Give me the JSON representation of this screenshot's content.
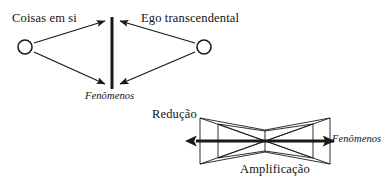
{
  "figure": {
    "stroke_color": "#1a1a1a",
    "background_color": "#ffffff",
    "diagram_left": {
      "name": "esquema-kantiano",
      "labels": {
        "left_node": "Coisas em si",
        "right_node": "Ego transcendental",
        "center_bar": "Fenômenos"
      },
      "nodes": [
        {
          "id": "coisas-em-si",
          "shape": "circle",
          "cx": 25,
          "cy": 47,
          "r": 7
        },
        {
          "id": "ego-transcendental",
          "shape": "circle",
          "cx": 204,
          "cy": 47,
          "r": 7
        }
      ],
      "center_bar": {
        "x": 112,
        "y1": 17,
        "y2": 89,
        "width": 3
      },
      "arrows": [
        {
          "from": "coisas-em-si",
          "to": "center-bar-top",
          "x1": 34,
          "y1": 42,
          "x2": 106,
          "y2": 20
        },
        {
          "from": "coisas-em-si",
          "to": "center-bar-bottom",
          "x1": 34,
          "y1": 53,
          "x2": 106,
          "y2": 85
        },
        {
          "from": "ego-transcendental",
          "to": "center-bar-top",
          "x1": 195,
          "y1": 42,
          "x2": 119,
          "y2": 20
        },
        {
          "from": "ego-transcendental",
          "to": "center-bar-bottom",
          "x1": 195,
          "y1": 53,
          "x2": 119,
          "y2": 85
        }
      ]
    },
    "diagram_right": {
      "name": "esquema-reducao-amplificacao",
      "labels": {
        "top_left": "Redução",
        "bottom": "Amplificação",
        "axis_right": "Fenômenos"
      },
      "axis": {
        "x1": 192,
        "x2": 338,
        "y": 141,
        "double_headed": true,
        "width": 3
      },
      "outer_bars": [
        {
          "id": "outer-left",
          "x": 200,
          "y1": 118,
          "y2": 164
        },
        {
          "id": "outer-right",
          "x": 330,
          "y1": 118,
          "y2": 164
        }
      ],
      "inner_bars": [
        {
          "id": "inner-left",
          "x": 218,
          "y1": 124,
          "y2": 158
        },
        {
          "id": "inner-right",
          "x": 313,
          "y1": 124,
          "y2": 158
        }
      ],
      "center_bar": {
        "id": "center",
        "x": 265,
        "y1": 131,
        "y2": 151
      }
    }
  }
}
